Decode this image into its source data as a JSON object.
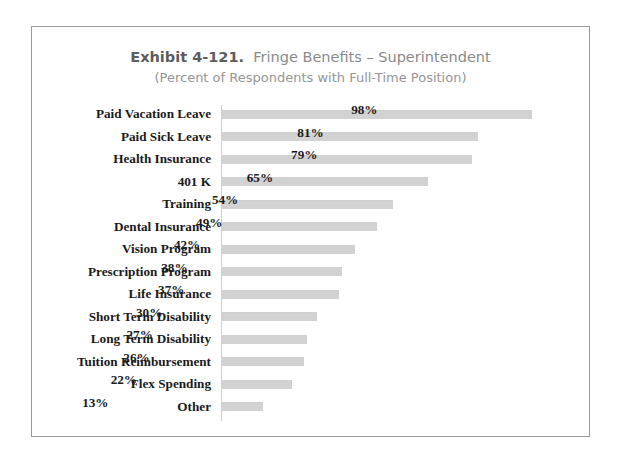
{
  "chart_data": {
    "type": "bar",
    "orientation": "horizontal",
    "title_prefix": "Exhibit 4-121.",
    "title_main": "Fringe Benefits – Superintendent",
    "subtitle": "(Percent of Respondents with Full-Time Position)",
    "xlabel": "",
    "ylabel": "",
    "xlim": [
      0,
      100
    ],
    "grid": false,
    "legend": "none",
    "value_suffix": "%",
    "bar_color": "#d2d2d2",
    "axis_color": "#cfcfcf",
    "border_color": "#9a9a9a",
    "text_color": "#1a1a1a",
    "title_color": "#5d5d5d",
    "subtitle_color": "#959595",
    "categories": [
      "Paid Vacation Leave",
      "Paid Sick Leave",
      "Health Insurance",
      "401 K",
      "Training",
      "Dental Insurance",
      "Vision Program",
      "Prescription Program",
      "Life Insurance",
      "Short Term Disability",
      "Long Term Disability",
      "Tuition Reimbursement",
      "Flex Spending",
      "Other"
    ],
    "values": [
      98,
      81,
      79,
      65,
      54,
      49,
      42,
      38,
      37,
      30,
      27,
      26,
      22,
      13
    ],
    "value_labels": [
      "98%",
      "81%",
      "79%",
      "65%",
      "54%",
      "49%",
      "42%",
      "38%",
      "37%",
      "30%",
      "27%",
      "26%",
      "22%",
      "13%"
    ]
  }
}
